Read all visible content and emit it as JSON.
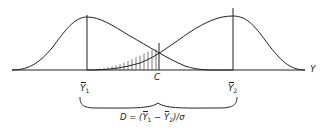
{
  "diagram": {
    "type": "overlapping-normal-distributions",
    "axis_label": "Y",
    "mean1_label": {
      "sym": "Y",
      "sub": "1"
    },
    "mean2_label": {
      "sym": "Y",
      "sub": "2"
    },
    "criterion_label": "C",
    "formula": {
      "prefix": "D = (",
      "a_sym": "Y",
      "a_sub": "1",
      "minus": " − ",
      "b_sym": "Y",
      "b_sub": "2",
      "suffix": ")/σ"
    },
    "colors": {
      "stroke": "#222222",
      "background": "#ffffff"
    }
  }
}
